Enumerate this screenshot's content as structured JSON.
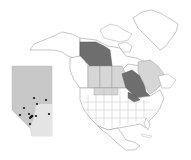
{
  "map": {
    "type": "choropleth",
    "region": "North America",
    "colors": {
      "background": "#ffffff",
      "land": "#ffffff",
      "border": "#a0a0a0",
      "dark_shade": "#6e6e6e",
      "light_shade": "#d6d6d6",
      "inset_fill": "#c8c8c8",
      "inset_fill_south": "#e4e4e4",
      "point": "#111111"
    },
    "shaded_regions": [
      {
        "name": "Yukon",
        "shade": "dark"
      },
      {
        "name": "Ontario",
        "shade": "dark"
      },
      {
        "name": "Alberta",
        "shade": "light"
      },
      {
        "name": "Saskatchewan",
        "shade": "light"
      },
      {
        "name": "Manitoba",
        "shade": "light"
      },
      {
        "name": "Quebec",
        "shade": "light"
      },
      {
        "name": "Montana/North Dakota border band",
        "shade": "light"
      },
      {
        "name": "Michigan/Great Lakes area",
        "shade": "dark"
      }
    ],
    "inset": {
      "name": "Alberta",
      "points": [
        {
          "x": 34,
          "y": 98
        },
        {
          "x": 46,
          "y": 100
        },
        {
          "x": 37,
          "y": 104
        },
        {
          "x": 24,
          "y": 108
        },
        {
          "x": 20,
          "y": 115
        },
        {
          "x": 29,
          "y": 114
        },
        {
          "x": 31,
          "y": 117
        },
        {
          "x": 32,
          "y": 116
        },
        {
          "x": 30,
          "y": 118
        },
        {
          "x": 36,
          "y": 116
        },
        {
          "x": 49,
          "y": 114
        },
        {
          "x": 30,
          "y": 124
        }
      ]
    }
  }
}
